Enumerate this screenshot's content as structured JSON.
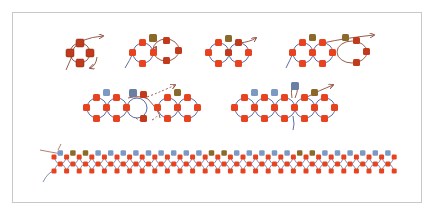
{
  "diagram": {
    "colors": {
      "bead_red": "#e8431e",
      "bead_red_dark": "#c23a1c",
      "bead_brown": "#8a6a2a",
      "bead_blue": "#7c99c4",
      "bead_blue_dark": "#6b7fa3",
      "thread_blue": "#4a5b9c",
      "thread_brown": "#8c4a3a",
      "frame": "#c8c8c8"
    },
    "figures": [
      {
        "id": "fig1",
        "label": "Step 1 - single loop of four beads",
        "beads": 4
      },
      {
        "id": "fig2",
        "label": "Step 2 - second loop added",
        "beads": 8
      },
      {
        "id": "fig3",
        "label": "Step 3 - two loops joined",
        "beads": 7
      },
      {
        "id": "fig4",
        "label": "Step 4 - third loop added",
        "beads": 12
      },
      {
        "id": "fig5",
        "label": "Step 5 - row with connector beads",
        "beads": 22
      },
      {
        "id": "fig6",
        "label": "Step 6 - row with blue accent beads",
        "beads": 22
      },
      {
        "id": "fig7",
        "label": "Step 7 - completed strip",
        "beads": 100
      }
    ]
  }
}
